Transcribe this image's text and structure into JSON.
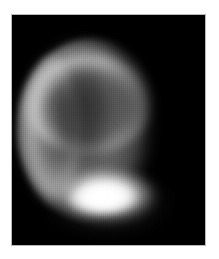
{
  "page": {
    "background_color": "#ffffff",
    "width": 219,
    "height": 259
  },
  "figure": {
    "kind": "astronomical-image",
    "alt_text": "Grayscale telescopic image of a planetary disk with a bright polar cap",
    "frame": {
      "background_color": "#000000",
      "border_color": "#b9b9b9",
      "left": 11,
      "top": 14,
      "width": 195,
      "height": 232
    },
    "subject": {
      "name": "planetary-disk",
      "shape": "oblate-disk",
      "center_x": 88,
      "center_y": 131,
      "radius_x": 70,
      "radius_y": 90
    },
    "features": [
      {
        "name": "bright-limb-arc-top",
        "description": "Bright illuminated limb arc along the upper and upper-left edge of the disk",
        "brightness": "#d2d2d2"
      },
      {
        "name": "bright-limb-arc-left",
        "description": "Bright limb brightening along the left edge of the disk",
        "brightness": "#c4c4c4"
      },
      {
        "name": "dark-albedo-patch",
        "description": "Large dark albedo region occupying the upper-left interior of the disk",
        "brightness": "#3c3c3c"
      },
      {
        "name": "mid-gray-hemisphere",
        "description": "Mid-gray body of the disk across the center and right hemisphere",
        "brightness": "#7c7c7c"
      },
      {
        "name": "terminator-shadow",
        "description": "Gradual fall-off to black along the right edge of the disk",
        "brightness": "#000000"
      },
      {
        "name": "bright-polar-cap",
        "description": "Very bright near-white polar cap at the bottom center of the disk",
        "brightness": "#ffffff"
      }
    ],
    "rendering": {
      "colormap": "grayscale",
      "texture": "vertical scan-line striping",
      "background_sky": "#000000"
    }
  }
}
